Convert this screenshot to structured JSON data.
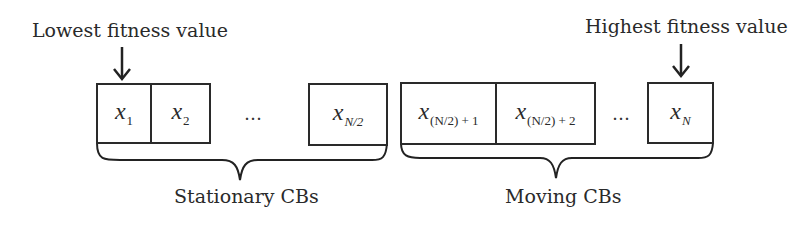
{
  "annotations": {
    "lowest": "Lowest fitness value",
    "highest": "Highest fitness value"
  },
  "groups": [
    {
      "label": "Stationary CBs",
      "cells": [
        {
          "base": "x",
          "sub": "1"
        },
        {
          "base": "x",
          "sub": "2"
        },
        {
          "ellipsis": "…"
        },
        {
          "base": "x",
          "sub": "N/2"
        }
      ]
    },
    {
      "label": "Moving CBs",
      "cells": [
        {
          "base": "x",
          "sub": "(N/2) + 1"
        },
        {
          "base": "x",
          "sub": "(N/2) + 2"
        },
        {
          "ellipsis": "…"
        },
        {
          "base": "x",
          "sub": "N"
        }
      ]
    }
  ],
  "colors": {
    "stroke": "#2a2a2a",
    "background": "#ffffff"
  }
}
